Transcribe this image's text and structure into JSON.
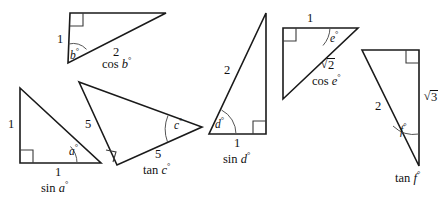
{
  "figure": {
    "stroke_color": "#1a1a1a",
    "background_color": "#ffffff",
    "mark_color": "#555555",
    "width": 448,
    "height": 202
  },
  "triangles": [
    {
      "id": "triangle-cos-b",
      "angle_label": "b",
      "angle_text": "b°",
      "ratio_name": "cos",
      "ratio_text": "cos b°",
      "side_labels": [
        "1",
        "2"
      ],
      "opposite_side": "1",
      "hypotenuse": "2",
      "right_angle": "top-left"
    },
    {
      "id": "triangle-sin-a",
      "angle_label": "a",
      "angle_text": "a°",
      "ratio_name": "sin",
      "ratio_text": "sin a°",
      "side_labels": [
        "1",
        "1"
      ],
      "vertical_side": "1",
      "base_side": "1",
      "right_angle": "bottom-left"
    },
    {
      "id": "triangle-tan-c",
      "angle_label": "c",
      "angle_text": "c°",
      "ratio_name": "tan",
      "ratio_text": "tan c°",
      "side_labels": [
        "5",
        "5"
      ],
      "upper_side": "5",
      "lower_side": "5",
      "right_angle": "bottom-left"
    },
    {
      "id": "triangle-sin-d",
      "angle_label": "d",
      "angle_text": "d°",
      "ratio_name": "sin",
      "ratio_text": "sin d°",
      "side_labels": [
        "2",
        "1"
      ],
      "hypotenuse": "2",
      "base_side": "1",
      "right_angle": "bottom-right"
    },
    {
      "id": "triangle-cos-e",
      "angle_label": "e",
      "angle_text": "e°",
      "ratio_name": "cos",
      "ratio_text": "cos e°",
      "side_labels": [
        "1",
        "√2"
      ],
      "top_side": "1",
      "hypotenuse_symbol": "√",
      "hypotenuse_radicand": "2",
      "right_angle": "top-left"
    },
    {
      "id": "triangle-tan-f",
      "angle_label": "f",
      "angle_text": "f°",
      "ratio_name": "tan",
      "ratio_text": "tan f°",
      "side_labels": [
        "2",
        "√3"
      ],
      "left_side": "2",
      "right_symbol": "√",
      "right_radicand": "3",
      "right_angle": "top-right"
    }
  ],
  "labels": {
    "t1_side1": "1",
    "t1_side2": "2",
    "t1_angle": "b",
    "t1_expr_fn": "cos",
    "t1_expr_var": "b",
    "t2_side_vert": "1",
    "t2_side_base": "1",
    "t2_angle": "a",
    "t2_expr_fn": "sin",
    "t2_expr_var": "a",
    "t3_side_upper": "5",
    "t3_side_lower": "5",
    "t3_angle": "c",
    "t3_expr_fn": "tan",
    "t3_expr_var": "c",
    "t4_side_hyp": "2",
    "t4_side_base": "1",
    "t4_angle": "d",
    "t4_expr_fn": "sin",
    "t4_expr_var": "d",
    "t5_side_top": "1",
    "t5_radicand": "2",
    "t5_angle": "e",
    "t5_expr_fn": "cos",
    "t5_expr_var": "e",
    "t6_side_left": "2",
    "t6_radicand": "3",
    "t6_angle": "f",
    "t6_expr_fn": "tan",
    "t6_expr_var": "f",
    "degree_symbol": "°",
    "radical_symbol": "√"
  }
}
